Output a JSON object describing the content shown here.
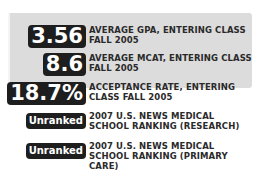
{
  "stats": [
    {
      "value": "3.56",
      "label": "AVERAGE GPA, ENTERING CLASS FALL 2005"
    },
    {
      "value": "8.6",
      "label": "AVERAGE MCAT, ENTERING CLASS FALL 2005"
    },
    {
      "value": "18.7%",
      "label": "ACCEPTANCE RATE, ENTERING CLASS FALL 2005"
    },
    {
      "value": "Unranked",
      "label": "2007 U.S. NEWS MEDICAL SCHOOL RANKING (RESEARCH)"
    },
    {
      "value": "Unranked",
      "label": "2007 U.S. NEWS MEDICAL SCHOOL RANKING (PRIMARY CARE)"
    }
  ],
  "colors": {
    "panel": "#dcdcdc",
    "badge": "#1e1e1e",
    "text": "#2a2a2a"
  }
}
